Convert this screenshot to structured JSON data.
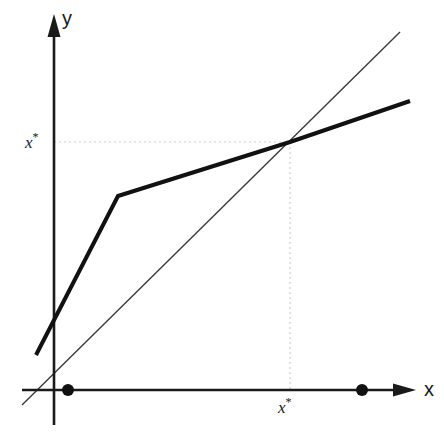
{
  "figure": {
    "kind": "cobweb-fixed-point-diagram",
    "background": "#ffffff",
    "width": 444,
    "height": 435
  },
  "axes": {
    "x_label": "x",
    "y_label": "y",
    "color": "#1a1a1a",
    "origin_px": {
      "x": 54,
      "y": 390
    },
    "y_axis": {
      "x_px": 54,
      "top_px": 18,
      "bottom_px": 425,
      "arrow": "up"
    },
    "x_axis": {
      "y_px": 390,
      "left_px": 22,
      "right_px": 415,
      "arrow": "right"
    }
  },
  "tick_labels": {
    "y_fixed_point": {
      "base": "x",
      "superscript": "*",
      "text": "x*"
    },
    "x_fixed_point": {
      "base": "x",
      "superscript": "*",
      "text": "x*"
    }
  },
  "chart_data": {
    "type": "line",
    "title": "",
    "xlabel": "x",
    "ylabel": "y",
    "grid": false,
    "legend": null,
    "annotations": [
      {
        "name": "fixed-point-x-tick",
        "text": "x*",
        "axis": "x",
        "x_px": 290
      },
      {
        "name": "fixed-point-y-tick",
        "text": "x*",
        "axis": "y",
        "y_px": 142
      }
    ],
    "series": [
      {
        "name": "map-function",
        "role": "piecewise-linear-map",
        "style": "thick-solid",
        "color": "#111111",
        "width_px": 4,
        "points_px": [
          {
            "x": 36,
            "y": 355
          },
          {
            "x": 118,
            "y": 196
          },
          {
            "x": 290,
            "y": 142
          },
          {
            "x": 410,
            "y": 101
          }
        ]
      },
      {
        "name": "identity-line",
        "role": "45-degree-diagonal",
        "style": "thin-solid",
        "color": "#3a3a3a",
        "width_px": 1.4,
        "points_px": [
          {
            "x": 22,
            "y": 405
          },
          {
            "x": 400,
            "y": 32
          }
        ]
      }
    ],
    "guides": [
      {
        "name": "horizontal-guide",
        "style": "dotted",
        "color": "#cfcfcf",
        "from_px": {
          "x": 54,
          "y": 142
        },
        "to_px": {
          "x": 290,
          "y": 142
        }
      },
      {
        "name": "vertical-guide",
        "style": "dotted",
        "color": "#cfcfcf",
        "from_px": {
          "x": 290,
          "y": 142
        },
        "to_px": {
          "x": 290,
          "y": 390
        }
      }
    ],
    "markers": [
      {
        "name": "x-axis-dot-left",
        "x_px": 68,
        "y_px": 390,
        "radius_px": 6,
        "color": "#111111"
      },
      {
        "name": "x-axis-dot-right",
        "x_px": 362,
        "y_px": 390,
        "radius_px": 6,
        "color": "#111111"
      }
    ],
    "intersection_px": {
      "x": 290,
      "y": 142
    },
    "kink_px": {
      "x": 118,
      "y": 196
    }
  }
}
